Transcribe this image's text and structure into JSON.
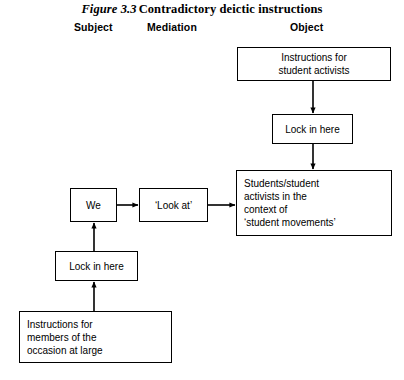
{
  "figure": {
    "number": "Figure 3.3",
    "caption": "Contradictory deictic instructions"
  },
  "columns": {
    "subject": "Subject",
    "mediation": "Mediation",
    "object": "Object"
  },
  "boxes": {
    "instructions_activists": "Instructions for\nstudent activists",
    "lock_top": "Lock in here",
    "object": "Students/student\nactivists in the\ncontext of\n‘student movements’",
    "we": "We",
    "look_at": "‘Look at’",
    "lock_bottom": "Lock in here",
    "instructions_members": "Instructions for\nmembers of the\noccasion at large"
  },
  "connectors": [
    {
      "name": "arrow-activists-to-lock-top",
      "from": "instructions_activists",
      "to": "lock_top",
      "direction": "down"
    },
    {
      "name": "arrow-lock-top-to-object",
      "from": "lock_top",
      "to": "object",
      "direction": "down"
    },
    {
      "name": "arrow-we-to-look-at",
      "from": "we",
      "to": "look_at",
      "direction": "right"
    },
    {
      "name": "arrow-look-at-to-object",
      "from": "look_at",
      "to": "object",
      "direction": "right"
    },
    {
      "name": "arrow-lock-bottom-to-we",
      "from": "lock_bottom",
      "to": "we",
      "direction": "up"
    },
    {
      "name": "arrow-members-to-lock-bottom",
      "from": "instructions_members",
      "to": "lock_bottom",
      "direction": "up"
    }
  ],
  "colors": {
    "line": "#000000",
    "background": "#ffffff",
    "text": "#000000"
  }
}
